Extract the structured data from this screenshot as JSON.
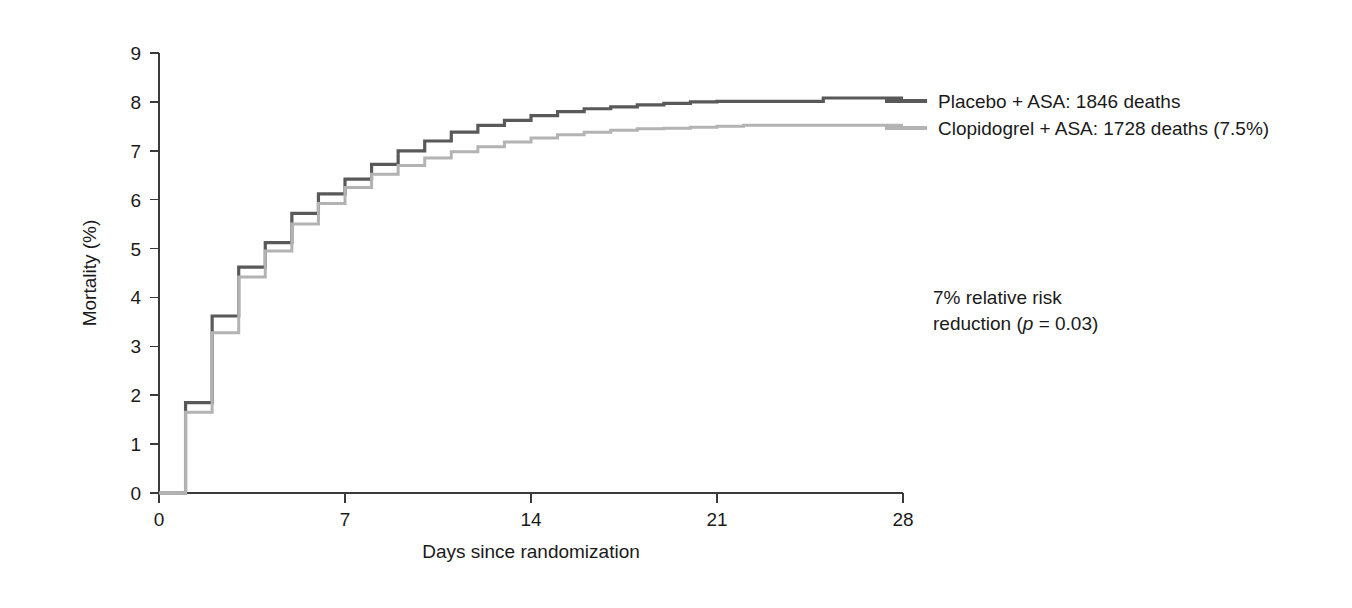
{
  "chart_data": {
    "type": "line",
    "title": "",
    "xlabel": "Days since randomization",
    "ylabel": "Mortality (%)",
    "xlim": [
      0,
      28
    ],
    "ylim": [
      0,
      9
    ],
    "xticks": [
      0,
      7,
      14,
      21,
      28
    ],
    "xtick_labels": [
      "0",
      "7",
      "14",
      "21",
      "28"
    ],
    "yticks": [
      0,
      1,
      2,
      3,
      4,
      5,
      6,
      7,
      8,
      9
    ],
    "ytick_labels": [
      "0",
      "1",
      "2",
      "3",
      "4",
      "5",
      "6",
      "7",
      "8",
      "9"
    ],
    "grid": false,
    "step_style": "post",
    "legend_position": "right",
    "series": [
      {
        "name": "Placebo + ASA: 1846 deaths",
        "color": "#595959",
        "x": [
          0,
          1,
          2,
          3,
          4,
          5,
          6,
          7,
          8,
          9,
          10,
          11,
          12,
          13,
          14,
          15,
          16,
          17,
          18,
          19,
          20,
          21,
          22,
          23,
          24,
          25,
          26,
          27,
          28
        ],
        "values": [
          0.0,
          1.85,
          3.62,
          4.62,
          5.12,
          5.72,
          6.12,
          6.42,
          6.72,
          7.0,
          7.2,
          7.38,
          7.52,
          7.62,
          7.72,
          7.8,
          7.86,
          7.9,
          7.94,
          7.97,
          8.0,
          8.01,
          8.01,
          8.01,
          8.01,
          8.08,
          8.08,
          8.08,
          8.08
        ]
      },
      {
        "name": "Clopidogrel + ASA: 1728 deaths (7.5%)",
        "color": "#b3b3b3",
        "x": [
          0,
          1,
          2,
          3,
          4,
          5,
          6,
          7,
          8,
          9,
          10,
          11,
          12,
          13,
          14,
          15,
          16,
          17,
          18,
          19,
          20,
          21,
          22,
          23,
          24,
          25,
          26,
          27,
          28
        ],
        "values": [
          0.0,
          1.65,
          3.28,
          4.42,
          4.95,
          5.5,
          5.92,
          6.25,
          6.52,
          6.7,
          6.85,
          6.98,
          7.08,
          7.18,
          7.26,
          7.33,
          7.38,
          7.42,
          7.45,
          7.46,
          7.48,
          7.5,
          7.52,
          7.52,
          7.52,
          7.52,
          7.52,
          7.52,
          7.52
        ]
      }
    ],
    "annotations": [
      {
        "name": "relative-risk-annotation",
        "line1": "7% relative risk",
        "line2_prefix": "reduction (",
        "line2_italic": "p",
        "line2_suffix": " = 0.03)"
      }
    ]
  },
  "legend": {
    "entries": [
      {
        "label": "Placebo + ASA: 1846 deaths",
        "color": "#595959"
      },
      {
        "label": "Clopidogrel + ASA: 1728 deaths (7.5%)",
        "color": "#b3b3b3"
      }
    ]
  }
}
